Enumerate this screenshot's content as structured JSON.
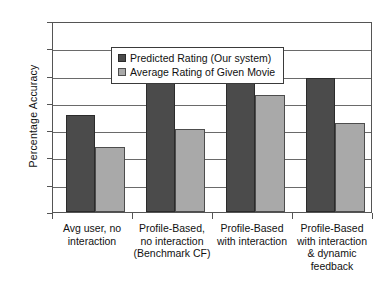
{
  "chart_data": {
    "type": "bar",
    "title": "",
    "subtitle": "",
    "xlabel": "",
    "ylabel": "Percentage Accuracy",
    "ylim": [
      77,
      84
    ],
    "ytick_step": 1,
    "yticks": [
      84,
      83,
      82,
      81,
      80,
      79,
      78,
      77
    ],
    "grid": true,
    "legend_position": "top-left inside plot",
    "categories": [
      "Avg user, no interaction",
      "Profile-Based, no interaction (Benchmark CF)",
      "Profile-Based with interaction",
      "Profile-Based with interaction & dynamic feedback"
    ],
    "category_label_lines": [
      [
        "Avg user, no",
        "interaction"
      ],
      [
        "Profile-Based,",
        "no interaction",
        "(Benchmark CF)"
      ],
      [
        "Profile-Based",
        "with interaction"
      ],
      [
        "Profile-Based",
        "with interaction",
        "& dynamic",
        "feedback"
      ]
    ],
    "series": [
      {
        "name": "Predicted Rating (Our system)",
        "color": "#4b4b4b",
        "values": [
          80.55,
          82.0,
          82.9,
          81.9
        ]
      },
      {
        "name": "Average Rating of Given Movie",
        "color": "#a9a9a9",
        "values": [
          79.4,
          80.05,
          81.3,
          80.25
        ]
      }
    ]
  },
  "colors": {
    "series_dark": "#4b4b4b",
    "series_light": "#a9a9a9",
    "axis": "#555555",
    "gridline": "#6a6a6a",
    "background": "#ffffff",
    "text": "#111111"
  }
}
